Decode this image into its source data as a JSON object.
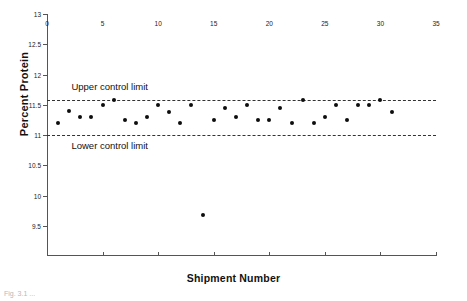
{
  "chart_data": {
    "type": "scatter",
    "title": "",
    "xlabel": "Shipment Number",
    "ylabel": "Percent Protein",
    "xlim": [
      0,
      35
    ],
    "ylim": [
      9,
      13
    ],
    "xticks": [
      0,
      5,
      10,
      15,
      20,
      25,
      30,
      35
    ],
    "ytick_labels": [
      "9.5",
      "10",
      "10.5",
      "11",
      "11.5",
      "12",
      "12.5",
      "13"
    ],
    "yticks": [
      9.5,
      10,
      10.5,
      11,
      11.5,
      12,
      12.5,
      13
    ],
    "grid": false,
    "legend_position": "none",
    "annotations": [
      {
        "text": "Upper control limit",
        "x": 2.2,
        "y": 11.79
      },
      {
        "text": "Lower control limit",
        "x": 2.2,
        "y": 10.82
      }
    ],
    "reference_lines": [
      {
        "name": "upper-control-limit",
        "value": 11.58,
        "style": "dashed"
      },
      {
        "name": "lower-control-limit",
        "value": 11.0,
        "style": "dashed"
      }
    ],
    "x": [
      1,
      2,
      3,
      4,
      5,
      6,
      7,
      8,
      9,
      10,
      11,
      12,
      13,
      14,
      15,
      16,
      17,
      18,
      19,
      20,
      21,
      22,
      23,
      24,
      25,
      26,
      27,
      28,
      29,
      30,
      31
    ],
    "values": [
      11.2,
      11.4,
      11.3,
      11.3,
      11.5,
      11.58,
      11.25,
      11.2,
      11.3,
      11.5,
      11.38,
      11.2,
      11.5,
      9.68,
      11.25,
      11.45,
      11.3,
      11.5,
      11.25,
      11.25,
      11.45,
      11.2,
      11.58,
      11.2,
      11.3,
      11.5,
      11.25,
      11.5,
      11.5,
      11.58,
      11.38
    ],
    "series": [
      {
        "name": "Percent Protein",
        "marker": "filled-circle",
        "color": "#0d0d0d",
        "values": [
          11.2,
          11.4,
          11.3,
          11.3,
          11.5,
          11.58,
          11.25,
          11.2,
          11.3,
          11.5,
          11.38,
          11.2,
          11.5,
          9.68,
          11.25,
          11.45,
          11.3,
          11.5,
          11.25,
          11.25,
          11.45,
          11.2,
          11.58,
          11.2,
          11.3,
          11.5,
          11.25,
          11.5,
          11.5,
          11.58,
          11.38
        ]
      }
    ]
  },
  "caption": "Fig. 3.1 ..."
}
